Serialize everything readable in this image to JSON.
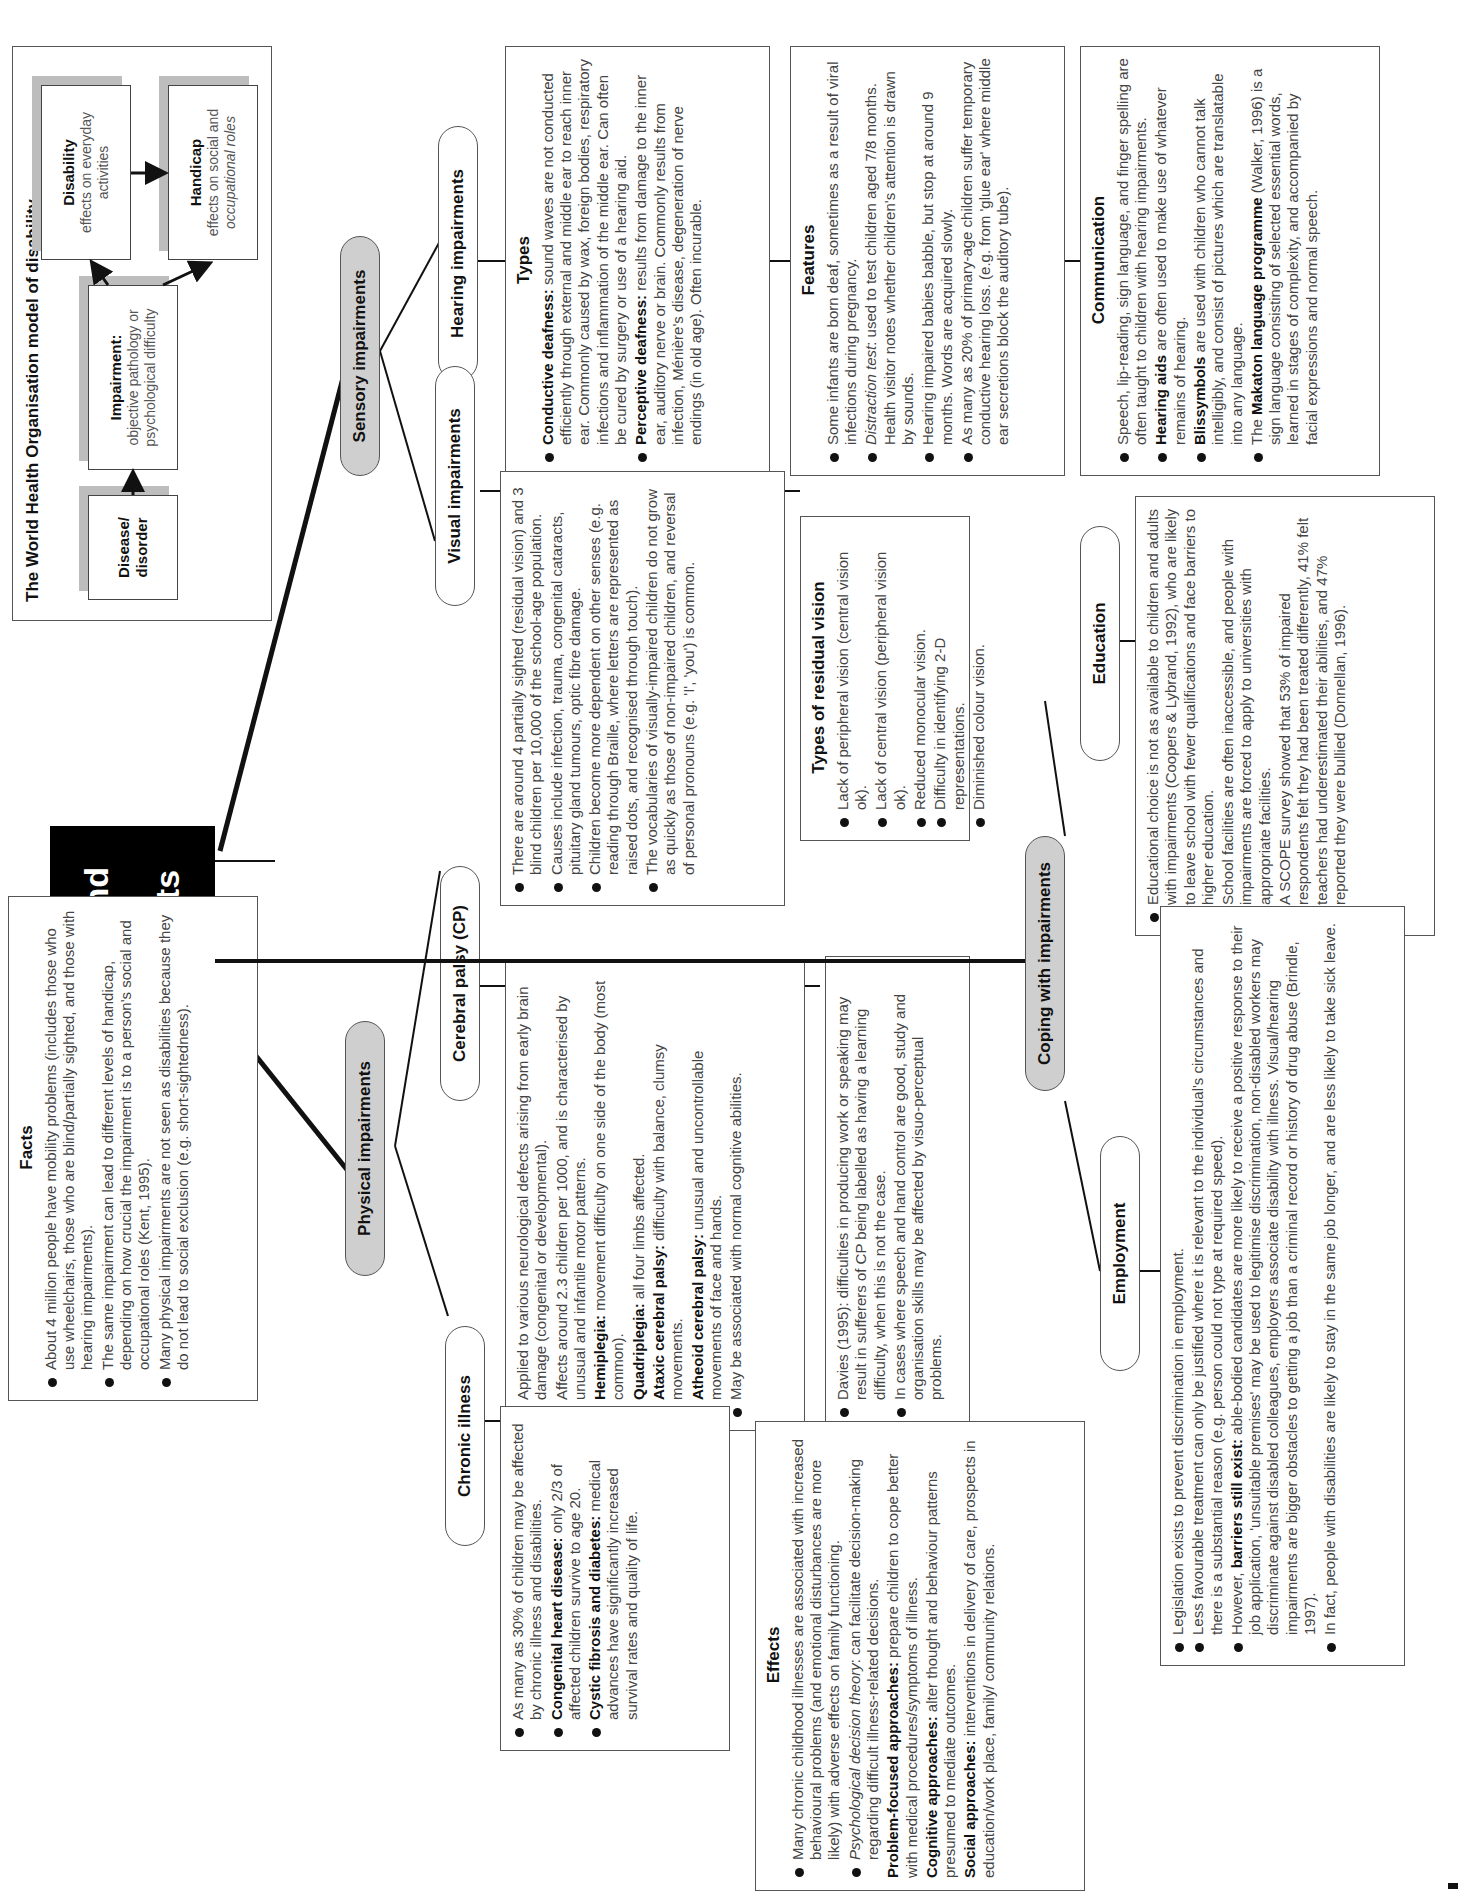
{
  "title": {
    "line1": "Physical and",
    "line2": "Sensory",
    "line3": "Impairments"
  },
  "who_model": {
    "title": "The World Health Organisation model of disability",
    "disease": {
      "label": "Disease/ disorder"
    },
    "impairment": {
      "label": "Impairment:",
      "desc": "objective pathology or psychological difficulty"
    },
    "disability": {
      "label": "Disability",
      "desc": "effects on everyday activities"
    },
    "handicap": {
      "label": "Handicap",
      "desc_plain": "effects on social and",
      "desc_italic": "occupational roles"
    }
  },
  "nodes": {
    "sensory": "Sensory impairments",
    "physical": "Physical impairments",
    "coping": "Coping with impairments",
    "hearing": "Hearing impairments",
    "visual": "Visual impairments",
    "cerebral": "Cerebral palsy (CP)",
    "chronic": "Chronic illness",
    "education": "Education",
    "employment": "Employment"
  },
  "hearing_types": {
    "heading": "Types",
    "items": [
      {
        "bold": "Conductive deafness:",
        "text": " sound waves are not conducted efficiently through external and middle ear to reach inner ear. Commonly caused by wax, foreign bodies, respiratory infections and inflammation of the middle ear. Can often be cured by surgery or use of a hearing aid."
      },
      {
        "bold": "Perceptive deafness:",
        "text": " results from damage to the inner ear, auditory nerve or brain. Commonly results from infection, Ménière's disease, degeneration of nerve endings (in old age). Often incurable."
      }
    ]
  },
  "hearing_features": {
    "heading": "Features",
    "items": [
      {
        "italic": "",
        "text": "Some infants are born deaf, sometimes as a result of viral infections during pregnancy."
      },
      {
        "italic": "Distraction test",
        "text": ": used to test children aged 7/8 months. Health visitor notes whether children's attention is drawn by sounds."
      },
      {
        "italic": "",
        "text": "Hearing impaired babies babble, but stop at around 9 months. Words are acquired slowly."
      },
      {
        "italic": "",
        "text": "As many as 20% of primary-age children suffer temporary conductive hearing loss. (e.g. from 'glue ear' where middle ear secretions block the auditory tube)."
      }
    ]
  },
  "hearing_communication": {
    "heading": "Communication",
    "items": [
      {
        "pre": "",
        "bold": "",
        "text": "Speech, lip-reading, sign language, and finger spelling are often taught to children with hearing impairments."
      },
      {
        "pre": "",
        "bold": "Hearing aids",
        "text": " are often used to make use of whatever remains of hearing."
      },
      {
        "pre": "",
        "bold": "Blissymbols",
        "text": " are used with children who cannot talk intelligibly, and consist of pictures which are translatable into any language."
      },
      {
        "pre": "The ",
        "bold": "Makaton language programme",
        "text": " (Walker, 1996) is a sign language consisting of selected essential words, learned in stages of complexity, and accompanied by facial expressions and normal speech."
      }
    ]
  },
  "visual_facts": {
    "items": [
      "There are around 4 partially sighted (residual vision) and 3 blind children per 10,000 of the school-age population.",
      "Causes include infection, trauma, congenital cataracts, pituitary gland tumours, optic fibre damage.",
      "Children become more dependent on other senses (e.g. reading through Braille, where letters are represented as raised dots, and recognised through touch).",
      "The vocabularies of visually-impaired children do not grow as quickly as those of non-impaired children, and reversal of personal pronouns (e.g. 'I', 'you') is common."
    ]
  },
  "residual_vision": {
    "heading": "Types of residual vision",
    "items": [
      "Lack of peripheral vision (central vision ok).",
      "Lack of central vision  (peripheral vision ok).",
      "Reduced monocular vision.",
      "Difficulty in identifying 2-D representations.",
      "Diminished colour vision."
    ]
  },
  "education": {
    "items": [
      "Educational choice is not as available to children and adults with impairments (Coopers & Lybrand, 1992), who are likely to leave school with fewer qualifications and face barriers to higher education.",
      "School facilities are often inaccessible, and people with impairments are forced to apply to universities with appropriate facilities.",
      "A SCOPE survey showed that 53% of impaired respondents felt they had been treated differently, 41% felt teachers had underestimated their abilities, and 47% reported they were bullied (Donnellan, 1996)."
    ]
  },
  "cerebral_palsy": {
    "items": [
      {
        "bullet": true,
        "bold": "",
        "text": "Applied to various neurological defects arising from early brain damage (congenital or developmental)."
      },
      {
        "bullet": true,
        "bold": "",
        "text": "Affects around 2.3 children per 1000, and is characterised by unusual and infantile motor patterns."
      },
      {
        "bullet": false,
        "bold": "Hemiplegia:",
        "text": " movement difficulty on one side of the body (most common)."
      },
      {
        "bullet": false,
        "bold": "Quadriplegia:",
        "text": " all four limbs affected."
      },
      {
        "bullet": false,
        "bold": "Ataxic cerebral palsy:",
        "text": " difficulty with balance, clumsy movements."
      },
      {
        "bullet": false,
        "bold": "Atheoid cerebral palsy:",
        "text": " unusual and uncontrollable movements of face  and hands."
      },
      {
        "bullet": true,
        "bold": "",
        "text": "May be associated with normal cognitive abilities."
      }
    ]
  },
  "cp_learning": {
    "items": [
      "Davies (1995): difficulties in producing work or speaking may result in sufferers of CP being labelled as having a learning difficulty, when this is not the case.",
      "In cases where speech and hand control are good, study and organisation skills may be affected by visuo-perceptual problems."
    ]
  },
  "employment": {
    "items": [
      {
        "pre": "",
        "bold": "",
        "text": "Legislation exists to prevent discrimination in employment."
      },
      {
        "pre": "",
        "bold": "",
        "text": "Less favourable treatment can only be justified where it is relevant to the individual's circumstances and there is a substantial reason (e.g. person could not type at required speed)."
      },
      {
        "pre": "However, ",
        "bold": "barriers still exist:",
        "text": " able-bodied candidates are more likely to receive a positive response to their job application, 'unsuitable premises' may be used to legitimise discrimination, non-disabled workers may discriminate against disabled colleagues, employers associate disability with illness. Visual/hearing impairments are bigger obstacles to getting a job than a criminal record  or history of drug abuse (Brindle, 1997)."
      },
      {
        "pre": "",
        "bold": "",
        "text": "In fact, people with disabilities are likely to stay in the same job longer, and are less likely to take sick leave."
      }
    ]
  },
  "facts": {
    "heading": "Facts",
    "items": [
      "About 4 million people have mobility problems (includes those who use wheelchairs, those who are blind/partially sighted, and those with hearing impairments).",
      "The same impairment can lead to different levels of handicap, depending on how crucial the impairment is to a person's social and occupational roles (Kent, 1995).",
      "Many physical impairments are not seen as disabilities because they do not lead to social exclusion (e.g. short-sightedness)."
    ]
  },
  "chronic_illness": {
    "items": [
      {
        "bold": "",
        "text": "As many as 30% of children may be affected by chronic illness and disabilities."
      },
      {
        "bold": "Congenital heart disease:",
        "text": " only 2/3 of affected children survive to age 20."
      },
      {
        "bold": "Cystic fibrosis and diabetes:",
        "text": " medical advances have significantly increased survival rates and quality of life."
      }
    ]
  },
  "effects": {
    "heading": "Effects",
    "items": [
      {
        "bullet": true,
        "italic": "",
        "bold": "",
        "text": "Many chronic childhood illnesses are associated with increased behavioural problems (and emotional disturbances are more likely) with adverse effects on family functioning."
      },
      {
        "bullet": true,
        "italic": "Psychological decision theory",
        "bold": "",
        "text": ": can facilitate decision-making regarding difficult illness-related decisions."
      },
      {
        "bullet": false,
        "italic": "",
        "bold": "Problem-focused approaches:",
        "text": " prepare children to cope better with medical procedures/symptoms of illness."
      },
      {
        "bullet": false,
        "italic": "",
        "bold": "Cognitive approaches:",
        "text": " alter thought and behaviour patterns presumed to mediate outcomes."
      },
      {
        "bullet": false,
        "italic": "",
        "bold": "Social approaches:",
        "text": " interventions in delivery of care, prospects in education/work place, family/ community relations."
      }
    ]
  }
}
